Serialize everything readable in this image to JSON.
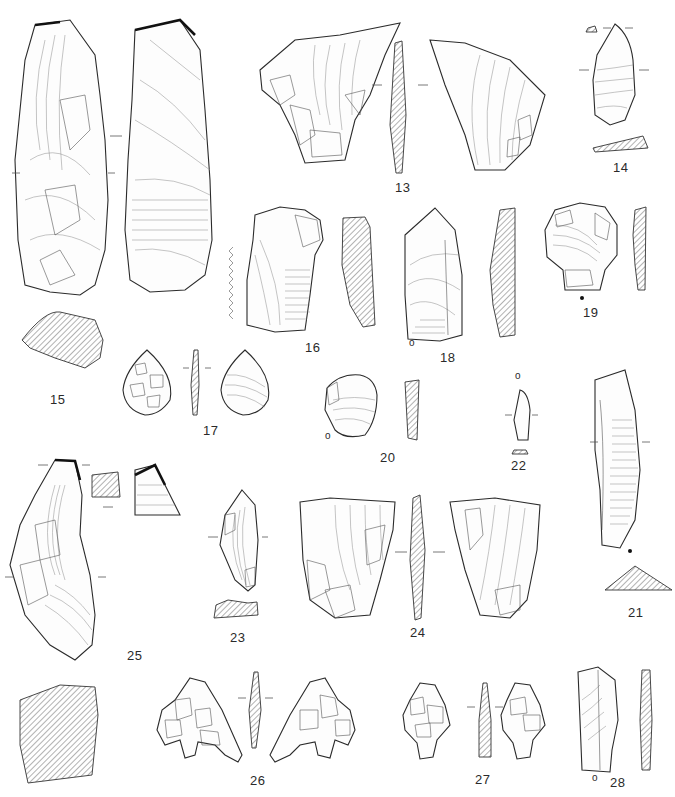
{
  "plate": {
    "background": "#ffffff",
    "line_color": "#2b2b2b",
    "hatch_color": "#555555"
  },
  "figures": [
    {
      "number": "13",
      "views": [
        "dorsal",
        "section",
        "ventral"
      ]
    },
    {
      "number": "14",
      "views": [
        "platform-section",
        "face",
        "section"
      ]
    },
    {
      "number": "15",
      "views": [
        "dorsal",
        "ventral",
        "section"
      ]
    },
    {
      "number": "16",
      "views": [
        "face",
        "section"
      ],
      "notes": "serrated edge indication at left"
    },
    {
      "number": "17",
      "views": [
        "dorsal",
        "section",
        "ventral"
      ]
    },
    {
      "number": "18",
      "views": [
        "face",
        "section"
      ],
      "marks": [
        "o"
      ]
    },
    {
      "number": "19",
      "views": [
        "face",
        "section"
      ],
      "marks": [
        "•"
      ]
    },
    {
      "number": "20",
      "views": [
        "face",
        "section"
      ],
      "marks": [
        "o"
      ]
    },
    {
      "number": "21",
      "views": [
        "face",
        "section"
      ],
      "marks": [
        "•"
      ]
    },
    {
      "number": "22",
      "views": [
        "face",
        "section"
      ],
      "marks": [
        "o"
      ]
    },
    {
      "number": "23",
      "views": [
        "face",
        "section"
      ]
    },
    {
      "number": "24",
      "views": [
        "dorsal",
        "section",
        "ventral"
      ]
    },
    {
      "number": "25",
      "views": [
        "face",
        "section",
        "detail",
        "section-large"
      ]
    },
    {
      "number": "26",
      "views": [
        "dorsal",
        "section",
        "ventral"
      ]
    },
    {
      "number": "27",
      "views": [
        "dorsal",
        "section",
        "ventral"
      ]
    },
    {
      "number": "28",
      "views": [
        "face",
        "section"
      ],
      "marks": [
        "o"
      ]
    }
  ],
  "labels": {
    "f13": "13",
    "f14": "14",
    "f15": "15",
    "f16": "16",
    "f17": "17",
    "f18": "18",
    "f19": "19",
    "f20": "20",
    "f21": "21",
    "f22": "22",
    "f23": "23",
    "f24": "24",
    "f25": "25",
    "f26": "26",
    "f27": "27",
    "f28": "28"
  }
}
